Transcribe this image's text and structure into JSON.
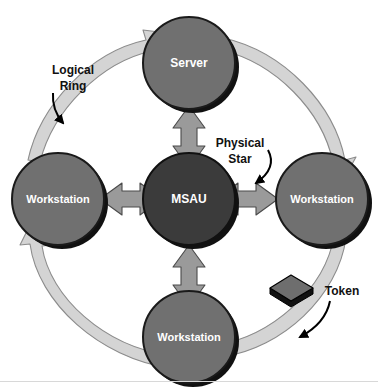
{
  "canvas": {
    "width": 378,
    "height": 392,
    "background": "#ffffff",
    "bottom_rule_color": "#d8d8d8"
  },
  "palette": {
    "hub_fill": "#3b3b3b",
    "node_fill": "#707070",
    "node_stroke": "#1a1a1a",
    "node_shadow": "#111111",
    "ring_fill": "#d4d4d4",
    "ring_stroke": "#8c8c8c",
    "star_arrow_fill": "#9a9a9a",
    "star_arrow_stroke": "#4a4a4a",
    "token_top_fill": "#6e6e6e",
    "token_side_fill": "#111111",
    "token_stroke": "#000000",
    "label_text": "#111111",
    "node_text": "#ffffff",
    "pointer_stroke": "#000000"
  },
  "diagram": {
    "type": "token-ring-network-topology",
    "nodes": [
      {
        "id": "server",
        "label": "Server",
        "role": "server",
        "position": "top",
        "cx": 189,
        "cy": 63,
        "r": 46,
        "fill": "#707070",
        "font_size": 12
      },
      {
        "id": "workstation-left",
        "label": "Workstation",
        "role": "workstation",
        "position": "left",
        "cx": 58,
        "cy": 199,
        "r": 46,
        "fill": "#707070",
        "font_size": 11
      },
      {
        "id": "msau",
        "label": "MSAU",
        "role": "hub",
        "position": "center",
        "cx": 189,
        "cy": 199,
        "r": 46,
        "fill": "#3b3b3b",
        "font_size": 12
      },
      {
        "id": "workstation-right",
        "label": "Workstation",
        "role": "workstation",
        "position": "right",
        "cx": 322,
        "cy": 199,
        "r": 46,
        "fill": "#707070",
        "font_size": 11
      },
      {
        "id": "workstation-bottom",
        "label": "Workstation",
        "role": "workstation",
        "position": "bottom",
        "cx": 189,
        "cy": 337,
        "r": 46,
        "fill": "#707070",
        "font_size": 11
      }
    ],
    "star_links": [
      {
        "id": "msau-server",
        "from": "msau",
        "to": "server",
        "orientation": "vertical",
        "bidirectional": true
      },
      {
        "id": "msau-workstation-left",
        "from": "msau",
        "to": "workstation-left",
        "orientation": "horizontal",
        "bidirectional": true
      },
      {
        "id": "msau-workstation-right",
        "from": "msau",
        "to": "workstation-right",
        "orientation": "horizontal",
        "bidirectional": true
      },
      {
        "id": "msau-workstation-bottom",
        "from": "msau",
        "to": "workstation-bottom",
        "orientation": "vertical",
        "bidirectional": true
      }
    ],
    "ring": {
      "direction": "clockwise",
      "segments": [
        {
          "id": "ring-segment-left-to-server",
          "from": "workstation-left",
          "to": "server"
        },
        {
          "id": "ring-segment-server-to-right",
          "from": "server",
          "to": "workstation-right"
        },
        {
          "id": "ring-segment-right-to-bottom",
          "from": "workstation-right",
          "to": "workstation-bottom"
        },
        {
          "id": "ring-segment-bottom-to-left",
          "from": "workstation-bottom",
          "to": "workstation-left"
        }
      ]
    },
    "token": {
      "label": "Token",
      "on_segment": "ring-segment-right-to-bottom",
      "x": 291,
      "y": 289
    }
  },
  "annotations": [
    {
      "id": "logical-ring",
      "lines": [
        "Logical",
        "Ring"
      ],
      "text_x": 73,
      "text_y": 70,
      "font_size": 12,
      "pointer": "curved-arrow-down-right",
      "target": "ring"
    },
    {
      "id": "physical-star",
      "lines": [
        "Physical",
        "Star"
      ],
      "text_x": 240,
      "text_y": 143,
      "font_size": 12,
      "pointer": "curved-arrow-down-left",
      "target": "star_links"
    },
    {
      "id": "token",
      "lines": [
        "Token"
      ],
      "text_x": 341,
      "text_y": 290,
      "font_size": 12,
      "pointer": "curved-arrow-down-left",
      "target": "token"
    }
  ]
}
